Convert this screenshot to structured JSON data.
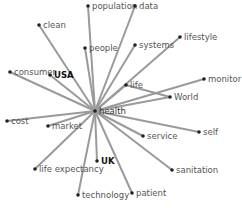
{
  "diagram": {
    "type": "network",
    "center": {
      "id": "health",
      "label": "health",
      "x": 95,
      "y": 111
    },
    "edge_color": "#9a9a9a",
    "node_color": "#222222",
    "nodes": [
      {
        "id": "population",
        "label": "population",
        "x": 88,
        "y": 6,
        "bold": false
      },
      {
        "id": "data",
        "label": "data",
        "x": 135,
        "y": 6,
        "bold": false
      },
      {
        "id": "clean",
        "label": "clean",
        "x": 39,
        "y": 25,
        "bold": false
      },
      {
        "id": "people",
        "label": "people",
        "x": 85,
        "y": 48,
        "bold": false
      },
      {
        "id": "systems",
        "label": "systems",
        "x": 135,
        "y": 45,
        "bold": false
      },
      {
        "id": "lifestyle",
        "label": "lifestyle",
        "x": 180,
        "y": 37,
        "bold": false
      },
      {
        "id": "consumer",
        "label": "consumer",
        "x": 10,
        "y": 72,
        "bold": false
      },
      {
        "id": "USA",
        "label": "USA",
        "x": 50,
        "y": 75,
        "bold": true
      },
      {
        "id": "life",
        "label": "life",
        "x": 126,
        "y": 85,
        "bold": false
      },
      {
        "id": "monitor",
        "label": "monitor",
        "x": 204,
        "y": 79,
        "bold": false
      },
      {
        "id": "World",
        "label": "World",
        "x": 170,
        "y": 97,
        "bold": false
      },
      {
        "id": "cost",
        "label": "cost",
        "x": 7,
        "y": 121,
        "bold": false
      },
      {
        "id": "market",
        "label": "market",
        "x": 48,
        "y": 126,
        "bold": false
      },
      {
        "id": "service",
        "label": "service",
        "x": 143,
        "y": 136,
        "bold": false
      },
      {
        "id": "self",
        "label": "self",
        "x": 199,
        "y": 132,
        "bold": false
      },
      {
        "id": "UK",
        "label": "UK",
        "x": 97,
        "y": 161,
        "bold": true
      },
      {
        "id": "life expectancy",
        "label": "life expectancy",
        "x": 35,
        "y": 169,
        "bold": false
      },
      {
        "id": "sanitation",
        "label": "sanitation",
        "x": 172,
        "y": 170,
        "bold": false
      },
      {
        "id": "technology",
        "label": "technology",
        "x": 78,
        "y": 195,
        "bold": false
      },
      {
        "id": "patient",
        "label": "patient",
        "x": 132,
        "y": 193,
        "bold": false
      }
    ],
    "crossing_edges": [
      {
        "from": "life",
        "to": "World"
      }
    ],
    "footer_text": ""
  }
}
